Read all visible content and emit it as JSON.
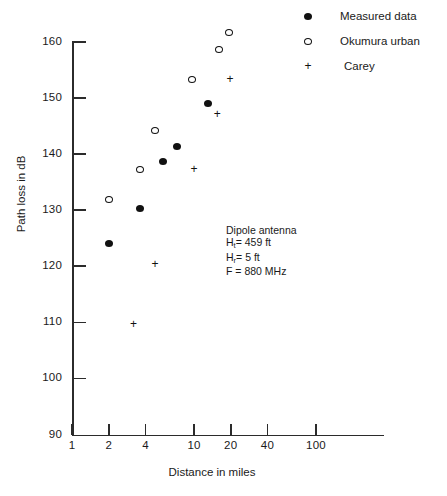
{
  "chart_data": {
    "type": "scatter",
    "title": "",
    "xlabel": "Distance in miles",
    "ylabel": "Path loss in dB",
    "xscale": "log",
    "xlim": [
      1,
      200
    ],
    "ylim": [
      90,
      160
    ],
    "grid": false,
    "xticks": [
      1,
      2,
      4,
      10,
      20,
      40,
      100
    ],
    "xtick_labels": [
      "1",
      "2",
      "4",
      "10",
      "20",
      "40",
      "100"
    ],
    "yticks": [
      90,
      100,
      110,
      120,
      130,
      140,
      150,
      160
    ],
    "ytick_labels": [
      "90",
      "100",
      "110",
      "120",
      "130",
      "140",
      "150",
      "160"
    ],
    "legend_position": "top-right",
    "series": [
      {
        "name": "Measured data",
        "marker": "filled-circle",
        "color": "#111111",
        "points": [
          {
            "x": 2.0,
            "y": 124.0
          },
          {
            "x": 3.6,
            "y": 130.3
          },
          {
            "x": 5.6,
            "y": 138.6
          },
          {
            "x": 7.2,
            "y": 141.4
          },
          {
            "x": 13.0,
            "y": 149.0
          }
        ]
      },
      {
        "name": "Okumura urban",
        "marker": "open-circle",
        "color": "#111111",
        "points": [
          {
            "x": 2.0,
            "y": 132.0
          },
          {
            "x": 3.6,
            "y": 137.3
          },
          {
            "x": 4.8,
            "y": 144.3
          },
          {
            "x": 9.7,
            "y": 153.3
          },
          {
            "x": 16.0,
            "y": 158.6
          },
          {
            "x": 19.5,
            "y": 161.7
          }
        ]
      },
      {
        "name": "Carey",
        "marker": "plus",
        "color": "#111111",
        "points": [
          {
            "x": 3.2,
            "y": 109.6
          },
          {
            "x": 4.8,
            "y": 120.3
          },
          {
            "x": 10.0,
            "y": 137.2
          },
          {
            "x": 15.5,
            "y": 147.1
          },
          {
            "x": 19.7,
            "y": 153.3
          }
        ]
      }
    ],
    "annotation": {
      "line1": "Dipole antenna",
      "line2_var": "H",
      "line2_sub": "t",
      "line2_val": "= 459 ft",
      "line3_var": "H",
      "line3_sub": "r",
      "line3_val": "= 5 ft",
      "line4": "F  = 880 MHz"
    }
  },
  "legend": {
    "items": [
      {
        "label": "Measured data",
        "marker": "filled-circle"
      },
      {
        "label": "Okumura urban",
        "marker": "open-circle"
      },
      {
        "label": "Carey",
        "marker": "plus"
      }
    ]
  }
}
